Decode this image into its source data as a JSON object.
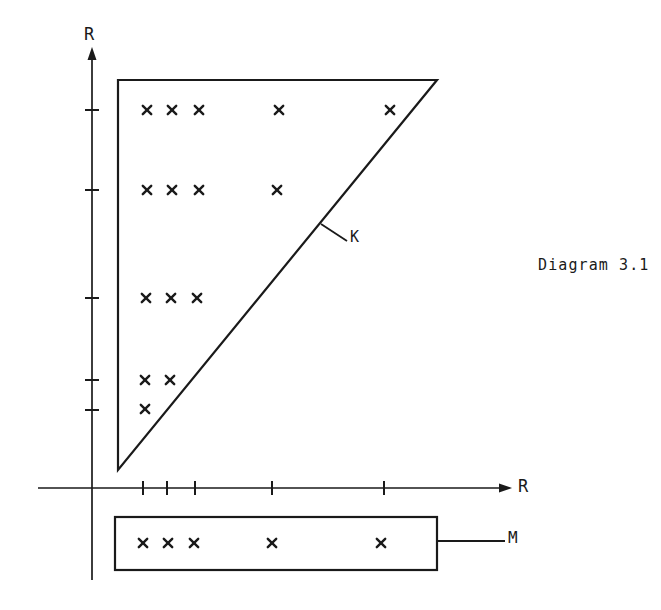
{
  "figure": {
    "caption": "Diagram 3.1",
    "background_color": "#ffffff",
    "ink_color": "#1a1a1a",
    "labels": {
      "y_axis": "R",
      "x_axis": "R",
      "hypotenuse": "K",
      "strip": "M"
    }
  },
  "chart_data": {
    "type": "scatter",
    "title": "Diagram 3.1",
    "xlabel": "R",
    "ylabel": "R",
    "grid": false,
    "legend": null,
    "axes": {
      "x_axis_y_px": 488,
      "y_axis_x_px": 92,
      "x_axis_extent_px": [
        38,
        512
      ],
      "y_axis_extent_px": [
        50,
        580
      ],
      "x_tick_positions_px": [
        143,
        167,
        195,
        272,
        384
      ],
      "y_tick_positions_px": [
        110,
        190,
        298,
        380,
        410
      ],
      "x_tick_labels": [
        "",
        "",
        "",
        "",
        ""
      ],
      "y_tick_labels": [
        "",
        "",
        "",
        "",
        ""
      ]
    },
    "region_K": {
      "name": "K",
      "shape": "triangle",
      "vertices_px": [
        [
          118,
          80
        ],
        [
          437,
          80
        ],
        [
          118,
          470
        ]
      ],
      "filled": false
    },
    "region_M": {
      "name": "M",
      "shape": "rectangle",
      "bounds_px": [
        115,
        517,
        437,
        570
      ],
      "filled": false
    },
    "points_in_K": [
      {
        "x_px": 147,
        "y_px": 110
      },
      {
        "x_px": 172,
        "y_px": 110
      },
      {
        "x_px": 199,
        "y_px": 110
      },
      {
        "x_px": 279,
        "y_px": 110
      },
      {
        "x_px": 390,
        "y_px": 110
      },
      {
        "x_px": 147,
        "y_px": 190
      },
      {
        "x_px": 172,
        "y_px": 190
      },
      {
        "x_px": 199,
        "y_px": 190
      },
      {
        "x_px": 277,
        "y_px": 190
      },
      {
        "x_px": 146,
        "y_px": 298
      },
      {
        "x_px": 171,
        "y_px": 298
      },
      {
        "x_px": 197,
        "y_px": 298
      },
      {
        "x_px": 145,
        "y_px": 380
      },
      {
        "x_px": 170,
        "y_px": 380
      },
      {
        "x_px": 145,
        "y_px": 409
      }
    ],
    "points_in_M": [
      {
        "x_px": 143,
        "y_px": 543
      },
      {
        "x_px": 168,
        "y_px": 543
      },
      {
        "x_px": 194,
        "y_px": 543
      },
      {
        "x_px": 272,
        "y_px": 543
      },
      {
        "x_px": 381,
        "y_px": 543
      }
    ],
    "callouts": [
      {
        "label": "K",
        "leader_from_px": [
          321,
          224
        ],
        "leader_to_px": [
          347,
          241
        ]
      },
      {
        "label": "M",
        "leader_from_px": [
          437,
          541
        ],
        "leader_to_px": [
          505,
          541
        ]
      }
    ]
  }
}
